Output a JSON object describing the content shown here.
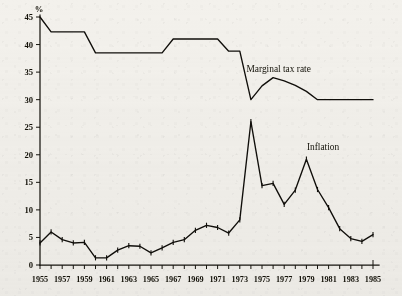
{
  "chart_data": {
    "type": "line",
    "title": "",
    "xlabel": "",
    "ylabel": "%",
    "ylim": [
      0,
      45
    ],
    "xlim": [
      1955,
      1985
    ],
    "grid": false,
    "legend_position": "inline-annotations",
    "y_ticks": [
      0,
      5,
      10,
      15,
      20,
      25,
      30,
      35,
      40,
      45
    ],
    "y_tick_labels": [
      "0",
      "5",
      "10",
      "15",
      "20",
      "25",
      "30",
      "35",
      "40",
      "45"
    ],
    "x_ticks": [
      1955,
      1956,
      1957,
      1958,
      1959,
      1960,
      1961,
      1962,
      1963,
      1964,
      1965,
      1966,
      1967,
      1968,
      1969,
      1970,
      1971,
      1972,
      1973,
      1974,
      1975,
      1976,
      1977,
      1978,
      1979,
      1980,
      1981,
      1982,
      1983,
      1984,
      1985
    ],
    "x_tick_labels": [
      "1955",
      "1957",
      "1959",
      "1961",
      "1963",
      "1965",
      "1967",
      "1969",
      "1971",
      "1973",
      "1975",
      "1977",
      "1979",
      "1981",
      "1983",
      "1985"
    ],
    "x_labeled_years": [
      1955,
      1957,
      1959,
      1961,
      1963,
      1965,
      1967,
      1969,
      1971,
      1973,
      1975,
      1977,
      1979,
      1981,
      1983,
      1985
    ],
    "series": [
      {
        "name": "Marginal tax rate",
        "annotation": "Marginal tax rate",
        "annotation_x": 1976.5,
        "annotation_y": 35.0,
        "markers": false,
        "x": [
          1955,
          1956,
          1957,
          1958,
          1959,
          1960,
          1961,
          1962,
          1963,
          1964,
          1965,
          1966,
          1967,
          1968,
          1969,
          1970,
          1971,
          1972,
          1973,
          1974,
          1975,
          1976,
          1977,
          1978,
          1979,
          1980,
          1981,
          1982,
          1983,
          1984,
          1985
        ],
        "values": [
          45.0,
          42.3,
          42.3,
          42.3,
          42.3,
          38.5,
          38.5,
          38.5,
          38.5,
          38.5,
          38.5,
          38.5,
          41.0,
          41.0,
          41.0,
          41.0,
          41.0,
          38.8,
          38.8,
          30.0,
          32.5,
          34.0,
          33.4,
          32.6,
          31.5,
          30.0,
          30.0,
          30.0,
          30.0,
          30.0,
          30.0
        ]
      },
      {
        "name": "Inflation",
        "annotation": "Inflation",
        "annotation_x": 1980.5,
        "annotation_y": 20.8,
        "markers": true,
        "x": [
          1955,
          1956,
          1957,
          1958,
          1959,
          1960,
          1961,
          1962,
          1963,
          1964,
          1965,
          1966,
          1967,
          1968,
          1969,
          1970,
          1971,
          1972,
          1973,
          1974,
          1975,
          1976,
          1977,
          1978,
          1979,
          1980,
          1981,
          1982,
          1983,
          1984,
          1985
        ],
        "values": [
          4.0,
          6.0,
          4.6,
          4.0,
          4.1,
          1.3,
          1.3,
          2.7,
          3.5,
          3.4,
          2.2,
          3.1,
          4.1,
          4.6,
          6.3,
          7.2,
          6.8,
          5.8,
          8.2,
          26.0,
          14.4,
          14.8,
          11.0,
          13.6,
          19.2,
          13.7,
          10.4,
          6.6,
          4.8,
          4.3,
          5.5
        ]
      }
    ],
    "annotations": [
      {
        "text": "Marginal tax rate",
        "x": 1976.5,
        "y": 35.0
      },
      {
        "text": "Inflation",
        "x": 1980.5,
        "y": 20.8
      }
    ]
  },
  "axes": {
    "y_unit_label": "%"
  }
}
